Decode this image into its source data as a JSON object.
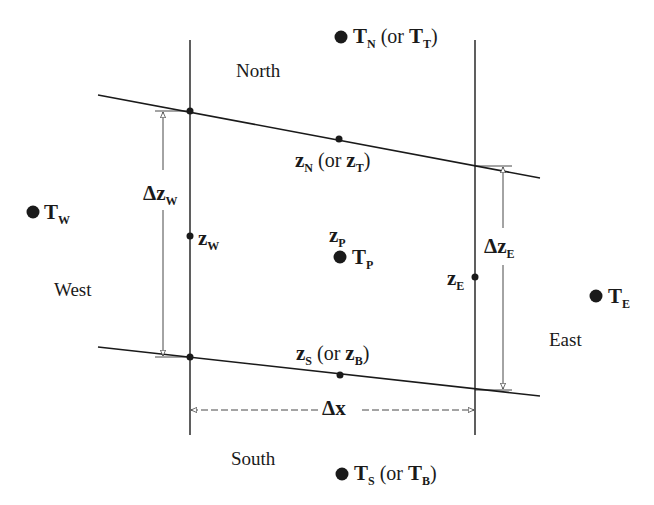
{
  "directions": {
    "north": "North",
    "south": "South",
    "west": "West",
    "east": "East"
  },
  "nodes": {
    "T_N": {
      "main": "T",
      "sub": "N",
      "alt_open": " (or ",
      "alt_main": "T",
      "alt_sub": "T",
      "alt_close": ")"
    },
    "T_S": {
      "main": "T",
      "sub": "S",
      "alt_open": " (or ",
      "alt_main": "T",
      "alt_sub": "B",
      "alt_close": ")"
    },
    "T_W": {
      "main": "T",
      "sub": "W"
    },
    "T_E": {
      "main": "T",
      "sub": "E"
    },
    "T_P": {
      "main": "T",
      "sub": "P"
    }
  },
  "faces": {
    "z_N": {
      "main": "z",
      "sub": "N",
      "alt_open": " (or ",
      "alt_main": "z",
      "alt_sub": "T",
      "alt_close": ")"
    },
    "z_S": {
      "main": "z",
      "sub": "S",
      "alt_open": " (or ",
      "alt_main": "z",
      "alt_sub": "B",
      "alt_close": ")"
    },
    "z_W": {
      "main": "z",
      "sub": "W"
    },
    "z_E": {
      "main": "z",
      "sub": "E"
    },
    "z_P": {
      "main": "z",
      "sub": "P"
    }
  },
  "dimensions": {
    "dz_W": {
      "main": "Δz",
      "sub": "W"
    },
    "dz_E": {
      "main": "Δz",
      "sub": "E"
    },
    "dx": {
      "main": "Δx"
    }
  },
  "colors": {
    "line": "#1a1a1a",
    "background": "#ffffff"
  }
}
